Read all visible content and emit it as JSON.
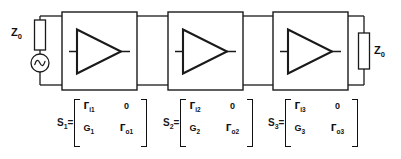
{
  "diagram": {
    "source": {
      "impedance_label": "Z",
      "impedance_sub": "0",
      "symbol": "ac-voltage-source"
    },
    "load": {
      "impedance_label": "Z",
      "impedance_sub": "0"
    },
    "stages": [
      {
        "name": "stage-1",
        "symbol": "amplifier-triangle"
      },
      {
        "name": "stage-2",
        "symbol": "amplifier-triangle"
      },
      {
        "name": "stage-3",
        "symbol": "amplifier-triangle"
      }
    ],
    "matrices": [
      {
        "label": "S",
        "label_sub": "1",
        "equals": "=",
        "cells": [
          {
            "sym": "Γ",
            "sub": "i1"
          },
          {
            "sym": "0",
            "sub": ""
          },
          {
            "sym": "G",
            "sub": "1"
          },
          {
            "sym": "Γ",
            "sub": "o1"
          }
        ]
      },
      {
        "label": "S",
        "label_sub": "2",
        "equals": "=",
        "cells": [
          {
            "sym": "Γ",
            "sub": "i2"
          },
          {
            "sym": "0",
            "sub": ""
          },
          {
            "sym": "G",
            "sub": "2"
          },
          {
            "sym": "Γ",
            "sub": "o2"
          }
        ]
      },
      {
        "label": "S",
        "label_sub": "3",
        "equals": "=",
        "cells": [
          {
            "sym": "Γ",
            "sub": "i3"
          },
          {
            "sym": "0",
            "sub": ""
          },
          {
            "sym": "G",
            "sub": "3"
          },
          {
            "sym": "Γ",
            "sub": "o3"
          }
        ]
      }
    ],
    "colors": {
      "wire": "#1a1a1a",
      "background": "#ffffff",
      "text": "#111111"
    }
  }
}
